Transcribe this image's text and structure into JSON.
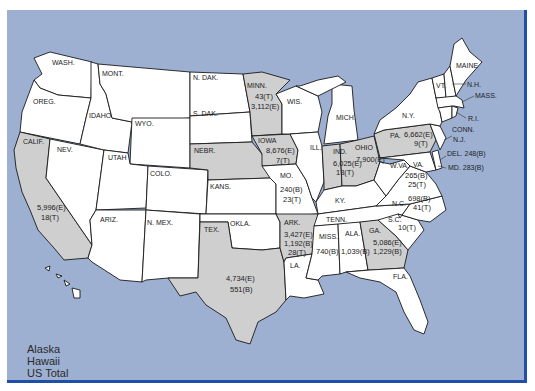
{
  "map": {
    "colors": {
      "ocean": "#9db0d2",
      "frame_border": "#1f4fa8",
      "state_default": "#ffffff",
      "state_highlighted": "#cfcfcf",
      "border": "#1a1a1a"
    },
    "states": [
      {
        "id": "wash",
        "label": "WASH.",
        "highlighted": false
      },
      {
        "id": "oreg",
        "label": "OREG.",
        "highlighted": false
      },
      {
        "id": "calif",
        "label": "CALIF.",
        "highlighted": true,
        "values": [
          "5,996(E)",
          "18(T)"
        ]
      },
      {
        "id": "nev",
        "label": "NEV.",
        "highlighted": false
      },
      {
        "id": "idaho",
        "label": "IDAHO",
        "highlighted": false
      },
      {
        "id": "mont",
        "label": "MONT.",
        "highlighted": false
      },
      {
        "id": "wyo",
        "label": "WYO.",
        "highlighted": false
      },
      {
        "id": "utah",
        "label": "UTAH",
        "highlighted": false
      },
      {
        "id": "colo",
        "label": "COLO.",
        "highlighted": false
      },
      {
        "id": "ariz",
        "label": "ARIZ.",
        "highlighted": false
      },
      {
        "id": "nmex",
        "label": "N. MEX.",
        "highlighted": false
      },
      {
        "id": "ndak",
        "label": "N. DAK.",
        "highlighted": false
      },
      {
        "id": "sdak",
        "label": "S. DAK.",
        "highlighted": false
      },
      {
        "id": "nebr",
        "label": "NEBR.",
        "highlighted": true
      },
      {
        "id": "kans",
        "label": "KANS.",
        "highlighted": false
      },
      {
        "id": "okla",
        "label": "OKLA.",
        "highlighted": false
      },
      {
        "id": "tex",
        "label": "TEX.",
        "highlighted": true,
        "values": [
          "4,734(E)",
          "551(B)"
        ]
      },
      {
        "id": "minn",
        "label": "MINN.",
        "highlighted": true,
        "values": [
          "43(T)",
          "3,112(E)"
        ]
      },
      {
        "id": "iowa",
        "label": "IOWA",
        "highlighted": true,
        "values": [
          "8,676(E)",
          "7(T)"
        ]
      },
      {
        "id": "mo",
        "label": "MO.",
        "highlighted": false,
        "values": [
          "240(B)",
          "23(T)"
        ]
      },
      {
        "id": "ark",
        "label": "ARK.",
        "highlighted": true,
        "values": [
          "3,427(E)",
          "1,192(B)",
          "28(T)"
        ]
      },
      {
        "id": "la",
        "label": "LA.",
        "highlighted": false
      },
      {
        "id": "wis",
        "label": "WIS.",
        "highlighted": false
      },
      {
        "id": "ill",
        "label": "ILL.",
        "highlighted": false
      },
      {
        "id": "mich",
        "label": "MICH.",
        "highlighted": false
      },
      {
        "id": "ind",
        "label": "IND.",
        "highlighted": true,
        "values": [
          "6,025(E)",
          "13(T)"
        ]
      },
      {
        "id": "ohio",
        "label": "OHIO",
        "highlighted": true,
        "values": [
          "7,900(E)"
        ]
      },
      {
        "id": "ky",
        "label": "KY.",
        "highlighted": false
      },
      {
        "id": "tenn",
        "label": "TENN.",
        "highlighted": false
      },
      {
        "id": "miss",
        "label": "MISS.",
        "highlighted": false,
        "values": [
          "740(B)"
        ]
      },
      {
        "id": "ala",
        "label": "ALA.",
        "highlighted": false,
        "values": [
          "1,039(B)"
        ]
      },
      {
        "id": "ga",
        "label": "GA.",
        "highlighted": true,
        "values": [
          "5,086(E)",
          "1,229(B)"
        ]
      },
      {
        "id": "fla",
        "label": "FLA.",
        "highlighted": false
      },
      {
        "id": "sc",
        "label": "S.C.",
        "highlighted": false,
        "values": [
          "10(T)"
        ]
      },
      {
        "id": "nc",
        "label": "N.C.",
        "highlighted": false,
        "values": [
          "698(B)",
          "41(T)"
        ]
      },
      {
        "id": "va",
        "label": "VA.",
        "highlighted": false,
        "values": [
          "265(B)",
          "25(T)"
        ]
      },
      {
        "id": "wva",
        "label": "W.VA.",
        "highlighted": false
      },
      {
        "id": "pa",
        "label": "PA.",
        "highlighted": true,
        "values": [
          "6,662(E)",
          "9(T)"
        ]
      },
      {
        "id": "ny",
        "label": "N.Y.",
        "highlighted": false
      },
      {
        "id": "vt",
        "label": "VT.",
        "highlighted": false
      },
      {
        "id": "nh",
        "label": "N.H.",
        "highlighted": false
      },
      {
        "id": "maine",
        "label": "MAINE",
        "highlighted": false
      },
      {
        "id": "mass",
        "label": "MASS.",
        "highlighted": false
      },
      {
        "id": "ri",
        "label": "R.I.",
        "highlighted": false
      },
      {
        "id": "conn",
        "label": "CONN.",
        "highlighted": false
      },
      {
        "id": "nj",
        "label": "N.J.",
        "highlighted": false
      },
      {
        "id": "del",
        "label": "DEL. 248(B)",
        "highlighted": false
      },
      {
        "id": "md",
        "label": "MD. 283(B)",
        "highlighted": false
      }
    ],
    "legend": [
      "Alaska",
      "Hawaii",
      "US Total"
    ]
  }
}
